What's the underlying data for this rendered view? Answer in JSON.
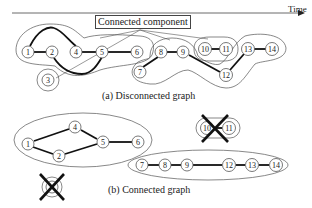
{
  "diagram": {
    "time_axis_label": "Time",
    "legend_label": "Connected component",
    "captions": {
      "top": "(a) Disconnected graph",
      "bottom": "(b) Connected graph"
    },
    "colors": {
      "edge": "#111111",
      "node_stroke": "#555555",
      "background": "#ffffff"
    },
    "top_graph": {
      "nodes": [
        "1",
        "2",
        "3",
        "4",
        "5",
        "6",
        "7",
        "8",
        "9",
        "10",
        "11",
        "12",
        "13",
        "14"
      ],
      "edges": [
        [
          "1",
          "2"
        ],
        [
          "1",
          "4"
        ],
        [
          "2",
          "5"
        ],
        [
          "4",
          "5"
        ],
        [
          "5",
          "6"
        ],
        [
          "7",
          "8"
        ],
        [
          "8",
          "9"
        ],
        [
          "9",
          "12"
        ],
        [
          "10",
          "11"
        ],
        [
          "12",
          "13"
        ],
        [
          "13",
          "14"
        ]
      ],
      "components": [
        [
          "1",
          "2",
          "4",
          "5",
          "6"
        ],
        [
          "3"
        ],
        [
          "7",
          "8",
          "9",
          "12",
          "13",
          "14"
        ],
        [
          "10",
          "11"
        ]
      ]
    },
    "bottom_graph": {
      "nodes": [
        "1",
        "2",
        "3",
        "4",
        "5",
        "6",
        "7",
        "8",
        "9",
        "10",
        "11",
        "12",
        "13",
        "14"
      ],
      "edges": [
        [
          "1",
          "4"
        ],
        [
          "1",
          "2"
        ],
        [
          "2",
          "5"
        ],
        [
          "4",
          "5"
        ],
        [
          "5",
          "6"
        ],
        [
          "7",
          "8"
        ],
        [
          "8",
          "9"
        ],
        [
          "9",
          "12"
        ],
        [
          "12",
          "13"
        ],
        [
          "13",
          "14"
        ],
        [
          "10",
          "11"
        ]
      ],
      "components": [
        [
          "1",
          "2",
          "4",
          "5",
          "6"
        ],
        [
          "7",
          "8",
          "9",
          "12",
          "13",
          "14"
        ]
      ],
      "removed": [
        [
          "3"
        ],
        [
          "10",
          "11"
        ]
      ]
    }
  }
}
